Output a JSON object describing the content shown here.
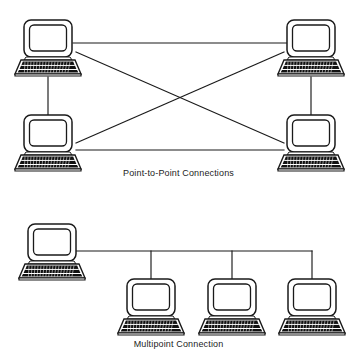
{
  "figure": {
    "background_color": "#ffffff",
    "line_color": "#1a1a1a",
    "fill_color": "#ffffff",
    "key_color": "#101010"
  },
  "panels": [
    {
      "id": "point-to-point",
      "caption": "Point-to-Point Connections",
      "topology": "full-mesh",
      "node_count": 4,
      "link_count": 6,
      "nodes": [
        {
          "id": "pp-node-top-left",
          "label": "computer",
          "x": 48,
          "y": 48
        },
        {
          "id": "pp-node-top-right",
          "label": "computer",
          "x": 311,
          "y": 48
        },
        {
          "id": "pp-node-bottom-left",
          "label": "computer",
          "x": 48,
          "y": 143
        },
        {
          "id": "pp-node-bottom-right",
          "label": "computer",
          "x": 311,
          "y": 143
        }
      ],
      "links": [
        {
          "id": "pp-link-top",
          "from": "pp-node-top-left",
          "to": "pp-node-top-right"
        },
        {
          "id": "pp-link-bottom",
          "from": "pp-node-bottom-left",
          "to": "pp-node-bottom-right"
        },
        {
          "id": "pp-link-left",
          "from": "pp-node-top-left",
          "to": "pp-node-bottom-left"
        },
        {
          "id": "pp-link-right",
          "from": "pp-node-top-right",
          "to": "pp-node-bottom-right"
        },
        {
          "id": "pp-link-diagonal-a",
          "from": "pp-node-top-left",
          "to": "pp-node-bottom-right"
        },
        {
          "id": "pp-link-diagonal-b",
          "from": "pp-node-top-right",
          "to": "pp-node-bottom-left"
        }
      ]
    },
    {
      "id": "multipoint",
      "caption": "Multipoint Connection",
      "topology": "bus",
      "node_count": 4,
      "link_count": 4,
      "nodes": [
        {
          "id": "mp-node-host",
          "label": "computer",
          "x": 52,
          "y": 252
        },
        {
          "id": "mp-node-drop-1",
          "label": "computer",
          "x": 151,
          "y": 305
        },
        {
          "id": "mp-node-drop-2",
          "label": "computer",
          "x": 232,
          "y": 305
        },
        {
          "id": "mp-node-drop-3",
          "label": "computer",
          "x": 312,
          "y": 305
        }
      ],
      "links": [
        {
          "id": "mp-link-bus",
          "from": "mp-node-host",
          "to": "bus"
        },
        {
          "id": "mp-link-drop-1",
          "from": "bus",
          "to": "mp-node-drop-1"
        },
        {
          "id": "mp-link-drop-2",
          "from": "bus",
          "to": "mp-node-drop-2"
        },
        {
          "id": "mp-link-drop-3",
          "from": "bus",
          "to": "mp-node-drop-3"
        }
      ]
    }
  ]
}
